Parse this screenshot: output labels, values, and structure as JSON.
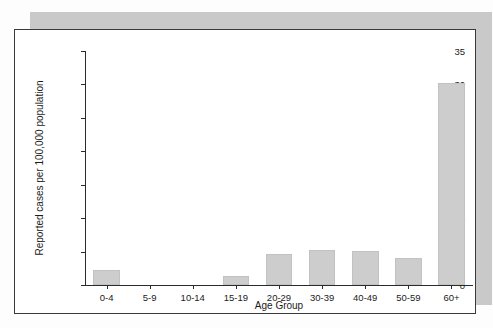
{
  "chart_data": {
    "type": "bar",
    "title": "",
    "xlabel": "Age Group",
    "ylabel": "Reported cases per 100,000 population",
    "categories": [
      "0-4",
      "5-9",
      "10-14",
      "15-19",
      "20-29",
      "30-39",
      "40-49",
      "50-59",
      "60+"
    ],
    "values": [
      2.3,
      0,
      0,
      1.3,
      4.6,
      5.2,
      5.1,
      4.1,
      30.2
    ],
    "ylim": [
      0,
      35
    ],
    "yticks": [
      0,
      5,
      10,
      15,
      20,
      25,
      30,
      35
    ],
    "ytick_labels": [
      "0",
      "5",
      "10",
      "15",
      "20",
      "25",
      "30",
      "35"
    ],
    "grid": false,
    "legend": null,
    "bar_color": "#cdcdcd",
    "axis_color": "#2b2b2b"
  },
  "figure": {
    "frame_border_color": "#3a3a3a",
    "shadow_color": "#c9c9c9",
    "background_color": "#ffffff"
  }
}
